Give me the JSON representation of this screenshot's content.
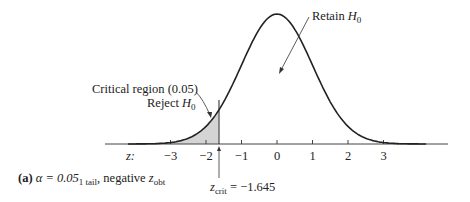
{
  "chart_data": {
    "type": "area",
    "title": "",
    "xlabel": "z:",
    "ylabel": "",
    "x_ticks": [
      -3,
      -2,
      -1,
      0,
      1,
      2,
      3
    ],
    "x_tick_labels": [
      "−3",
      "−2",
      "−1",
      "0",
      "1",
      "2",
      "3"
    ],
    "xlim": [
      -4.2,
      4.2
    ],
    "grid": false,
    "legend": "none",
    "shaded_region": {
      "from": -4.2,
      "to": -1.645,
      "color": "#d4d4d4"
    },
    "critical_value": -1.645,
    "annotations": [
      {
        "text": "Retain H0",
        "points_to": "center of distribution"
      },
      {
        "text": "Critical region (0.05) Reject H0",
        "points_to": "shaded left tail"
      },
      {
        "text": "z_crit = −1.645",
        "points_to": "critical line"
      }
    ]
  },
  "labels": {
    "retain": "Retain ",
    "retain_h": "H",
    "retain_sub": "0",
    "critical_region": "Critical region (0.05)",
    "reject": "Reject ",
    "reject_h": "H",
    "reject_sub": "0",
    "z_axis": "z:",
    "zcrit_z": "z",
    "zcrit_sub": "crit",
    "zcrit_value": " = −1.645"
  },
  "ticks": [
    "−3",
    "−2",
    "−1",
    "0",
    "1",
    "2",
    "3"
  ],
  "caption": {
    "part": "(a)",
    "alpha": " α = 0.05",
    "alpha_sub": "1 tail",
    "rest": ", negative ",
    "z": "z",
    "z_sub": "obt"
  },
  "colors": {
    "curve": "#222222",
    "shade": "#d4d4d4",
    "axis": "#444444"
  }
}
